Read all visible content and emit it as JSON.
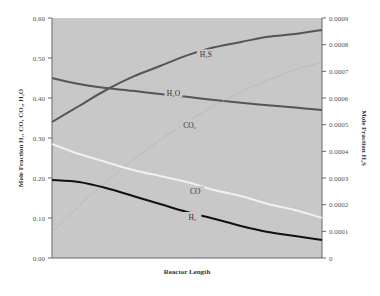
{
  "chart_data": {
    "type": "line",
    "title": "",
    "xlabel": "Reactor Length",
    "ylabel": "Mole Fraction H2, CO, CO2, H2O",
    "ylabel_display": "Mole Fraction H₂, CO, CO₂, H₂O",
    "y2label": "Mole Fraction H2S",
    "y2label_display": "Mole Fraction H₂S",
    "ylim": [
      0,
      0.6
    ],
    "y2lim": [
      0,
      0.0009
    ],
    "yticks": [
      "0.00",
      "0.10",
      "0.20",
      "0.30",
      "0.40",
      "0.50",
      "0.60"
    ],
    "y2ticks": [
      "0",
      "0.0001",
      "0.0002",
      "0.0003",
      "0.0004",
      "0.0005",
      "0.0006",
      "0.0007",
      "0.0008",
      "0.0009"
    ],
    "grid": false,
    "legend": "inline labels",
    "plot_background": "#c8c8c8",
    "x": [
      0,
      0.1,
      0.2,
      0.3,
      0.4,
      0.5,
      0.6,
      0.7,
      0.8,
      0.9,
      1.0
    ],
    "series": [
      {
        "name": "H2O",
        "label": "H₂O",
        "axis": "left",
        "color": "#555555",
        "values": [
          0.45,
          0.435,
          0.425,
          0.418,
          0.41,
          0.403,
          0.395,
          0.388,
          0.382,
          0.376,
          0.37
        ],
        "label_pos": [
          0.45,
          0.41
        ]
      },
      {
        "name": "H2S",
        "label": "H₂S",
        "axis": "right",
        "color": "#555555",
        "values": [
          0.00051,
          0.00057,
          0.00063,
          0.00068,
          0.00072,
          0.00076,
          0.00079,
          0.00081,
          0.00083,
          0.00084,
          0.000855
        ],
        "label_pos": [
          0.57,
          0.00076
        ]
      },
      {
        "name": "CO2",
        "label": "CO₂",
        "axis": "left",
        "color": "#b0b0b0",
        "dashed": true,
        "values": [
          0.065,
          0.13,
          0.19,
          0.245,
          0.295,
          0.34,
          0.38,
          0.415,
          0.445,
          0.47,
          0.49
        ],
        "label_pos": [
          0.51,
          0.33
        ]
      },
      {
        "name": "CO",
        "label": "CO",
        "axis": "left",
        "color": "#f0f0f0",
        "values": [
          0.285,
          0.26,
          0.24,
          0.22,
          0.205,
          0.19,
          0.17,
          0.155,
          0.135,
          0.12,
          0.1
        ],
        "label_pos": [
          0.53,
          0.165
        ]
      },
      {
        "name": "H2",
        "label": "H₂",
        "axis": "left",
        "color": "#111111",
        "values": [
          0.195,
          0.19,
          0.175,
          0.155,
          0.135,
          0.115,
          0.098,
          0.08,
          0.065,
          0.055,
          0.045
        ],
        "label_pos": [
          0.52,
          0.1
        ]
      }
    ]
  }
}
